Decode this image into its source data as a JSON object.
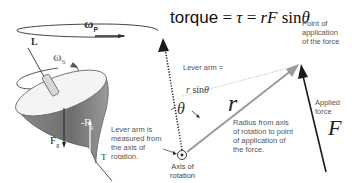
{
  "diagram": {
    "equation": {
      "word": "torque",
      "eq1": " = ",
      "tau": "τ",
      "eq2": " = ",
      "rF": "rF",
      "sin": " sin",
      "theta": "θ"
    },
    "top": {
      "omega_p": "ω",
      "omega_p_sub": "P",
      "omega_s": "ω",
      "omega_s_sub": "S",
      "L_label": "L",
      "Fg_label": "F",
      "Fg_sub": "g",
      "negFg_label": "-F",
      "negFg_sub": "g",
      "T_label": "T"
    },
    "labels": {
      "lever_arm_title": "Lever arm =",
      "lever_arm_formula_r": "r",
      "lever_arm_formula_sin": " sin",
      "lever_arm_formula_theta": "θ",
      "theta": "θ",
      "r": "r",
      "F": "F",
      "point_of_application": "Point of\napplication\nof the force",
      "applied_force": "Applied\nforce",
      "radius_desc": "Radius from axis\nof rotation to point\nof application of\nthe force.",
      "lever_arm_measured": "Lever arm is\nmeasured from\nthe axis of\nrotation.",
      "axis_of_rotation": "Axis of\nrotation"
    },
    "colors": {
      "ink": "#222222",
      "gray_vector": "#9a9a9a",
      "top_shadow": "#7a7a7a",
      "top_light": "#f2f2f2"
    }
  }
}
